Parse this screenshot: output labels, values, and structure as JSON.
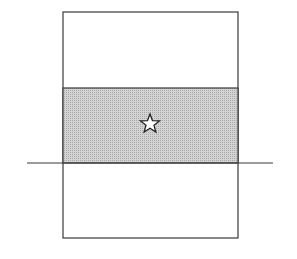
{
  "diagram": {
    "colors": {
      "background": "#ffffff",
      "stroke": "#3a3a3a",
      "shade": "#c8c8c8",
      "star_fill": "#ffffff"
    },
    "outer_rect": {
      "x": 63,
      "y": 12,
      "width": 175,
      "height": 226
    },
    "shaded_band": {
      "x": 63,
      "y": 88,
      "width": 175,
      "height": 75
    },
    "horizontal_line": {
      "x1": 27,
      "x2": 273,
      "y": 163
    },
    "star": {
      "cx": 150,
      "cy": 124,
      "outer_r": 10,
      "inner_r": 4.2,
      "icon": "star-icon"
    }
  }
}
